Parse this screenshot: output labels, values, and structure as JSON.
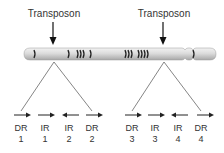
{
  "diagram": {
    "title_labels": [
      {
        "text": "Transposon",
        "x": 54
      },
      {
        "text": "Transposon",
        "x": 164
      }
    ],
    "colors": {
      "chromosome_fill": "#d8d8d8",
      "chromosome_highlight": "#f0f0f0",
      "band": "#2a2a2a",
      "line": "#555555",
      "text": "#333333"
    },
    "repeats": [
      {
        "type": "DR",
        "num": "1",
        "direction": "right"
      },
      {
        "type": "IR",
        "num": "1",
        "direction": "right"
      },
      {
        "type": "IR",
        "num": "2",
        "direction": "left"
      },
      {
        "type": "DR",
        "num": "2",
        "direction": "right"
      },
      {
        "type": "DR",
        "num": "3",
        "direction": "right"
      },
      {
        "type": "IR",
        "num": "3",
        "direction": "right"
      },
      {
        "type": "IR",
        "num": "4",
        "direction": "left"
      },
      {
        "type": "DR",
        "num": "4",
        "direction": "right"
      }
    ]
  }
}
